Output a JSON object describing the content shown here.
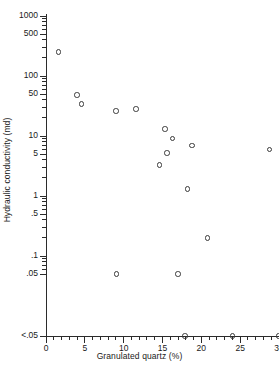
{
  "chart_data": {
    "type": "scatter",
    "title": "",
    "xlabel": "Granulated quartz (%)",
    "ylabel": "Hydraulic conductivity (md)",
    "xlim": [
      0,
      30
    ],
    "ylim_labels": [
      "<.05",
      ".05",
      ".1",
      ".5",
      "1",
      "5",
      "10",
      "50",
      "100",
      "500",
      "1000"
    ],
    "yscale": "log",
    "grid": false,
    "legend": null,
    "xticks": [
      0,
      5,
      10,
      15,
      20,
      25,
      30
    ],
    "xtick_labels": [
      "0",
      "5",
      "10",
      "15",
      "20",
      "25",
      "30"
    ],
    "yticks": [
      {
        "label": "1000",
        "value": 1000
      },
      {
        "label": "500",
        "value": 500
      },
      {
        "label": "100",
        "value": 100
      },
      {
        "label": "50",
        "value": 50
      },
      {
        "label": "10",
        "value": 10
      },
      {
        "label": "5",
        "value": 5
      },
      {
        "label": "1",
        "value": 1
      },
      {
        "label": ".5",
        "value": 0.5
      },
      {
        "label": ".1",
        "value": 0.1
      },
      {
        "label": ".05",
        "value": 0.05
      },
      {
        "label": "<.05",
        "value": 0.025
      }
    ],
    "points": [
      {
        "x": 1.6,
        "y": 250
      },
      {
        "x": 4.0,
        "y": 48
      },
      {
        "x": 4.6,
        "y": 34
      },
      {
        "x": 9.0,
        "y": 26
      },
      {
        "x": 11.6,
        "y": 28
      },
      {
        "x": 9.1,
        "y": 0.05
      },
      {
        "x": 15.3,
        "y": 13
      },
      {
        "x": 16.3,
        "y": 9.0
      },
      {
        "x": 15.6,
        "y": 5.2
      },
      {
        "x": 14.6,
        "y": 3.3
      },
      {
        "x": 17.0,
        "y": 0.05
      },
      {
        "x": 17.9,
        "y": 0.025
      },
      {
        "x": 18.8,
        "y": 7.0
      },
      {
        "x": 18.2,
        "y": 1.3
      },
      {
        "x": 20.8,
        "y": 0.2
      },
      {
        "x": 24.0,
        "y": 0.025
      },
      {
        "x": 28.8,
        "y": 6.0
      },
      {
        "x": 29.9,
        "y": 0.025
      }
    ]
  },
  "axis": {
    "color": "#2b2b2b",
    "marker_color": "#3a3a3a"
  }
}
